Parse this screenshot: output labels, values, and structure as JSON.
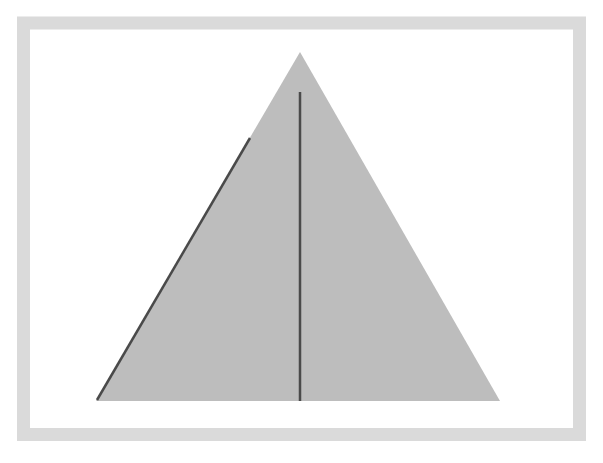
{
  "figure": {
    "colors": {
      "background": "#ffffff",
      "frame": "#dadada",
      "triangle_fill": "#bdbdbd",
      "lines": "#4a4a4a"
    },
    "shapes": [
      {
        "name": "frame",
        "type": "rectangle-outline"
      },
      {
        "name": "triangle",
        "type": "triangle"
      },
      {
        "name": "altitude-line",
        "type": "line"
      },
      {
        "name": "left-edge-line",
        "type": "line"
      }
    ]
  }
}
